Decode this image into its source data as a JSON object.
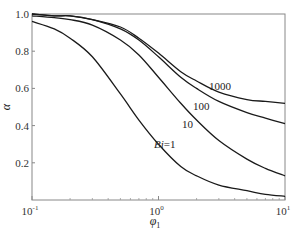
{
  "chart_data": {
    "type": "line",
    "title": "",
    "xlabel": "φ1",
    "ylabel": "α",
    "xscale": "log",
    "xlim": [
      0.1,
      10
    ],
    "ylim": [
      0,
      1.0
    ],
    "grid": false,
    "legend": "inline curve labels",
    "x_ticks": [
      {
        "value": 0.1,
        "base": "10",
        "exp": "-1"
      },
      {
        "value": 1,
        "base": "10",
        "exp": "0"
      },
      {
        "value": 10,
        "base": "10",
        "exp": "1"
      }
    ],
    "y_ticks": [
      {
        "value": 0.2,
        "label": "0.2"
      },
      {
        "value": 0.4,
        "label": "0.4"
      },
      {
        "value": 0.6,
        "label": "0.6"
      },
      {
        "value": 0.8,
        "label": "0.8"
      },
      {
        "value": 1.0,
        "label": "1.0"
      }
    ],
    "x": [
      0.1,
      0.15,
      0.2,
      0.3,
      0.5,
      0.7,
      1.0,
      1.5,
      2,
      3,
      5,
      7,
      10
    ],
    "series": [
      {
        "name": "Bi=1",
        "label": "Bi=1",
        "values": [
          0.96,
          0.92,
          0.87,
          0.77,
          0.57,
          0.43,
          0.3,
          0.18,
          0.13,
          0.08,
          0.05,
          0.03,
          0.02
        ]
      },
      {
        "name": "Bi=10",
        "label": "10",
        "values": [
          0.99,
          0.98,
          0.97,
          0.94,
          0.86,
          0.78,
          0.66,
          0.52,
          0.43,
          0.32,
          0.22,
          0.17,
          0.13
        ]
      },
      {
        "name": "Bi=100",
        "label": "100",
        "values": [
          1.0,
          0.99,
          0.99,
          0.97,
          0.92,
          0.86,
          0.77,
          0.66,
          0.6,
          0.53,
          0.47,
          0.44,
          0.41
        ]
      },
      {
        "name": "Bi=1000",
        "label": "1000",
        "values": [
          1.0,
          0.99,
          0.99,
          0.97,
          0.93,
          0.87,
          0.79,
          0.69,
          0.64,
          0.58,
          0.54,
          0.53,
          0.52
        ]
      }
    ]
  }
}
